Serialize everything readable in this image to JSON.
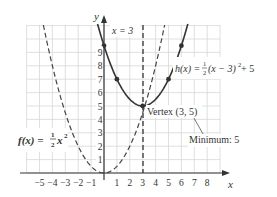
{
  "chart_data": {
    "type": "line",
    "title": "",
    "xlabel": "x",
    "ylabel": "y",
    "xlim": [
      -6,
      9
    ],
    "ylim": [
      -0.5,
      11
    ],
    "grid": true,
    "x_ticks": [
      "-5",
      "-4",
      "-3",
      "-2",
      "-1",
      "1",
      "2",
      "3",
      "4",
      "5",
      "6",
      "7",
      "8"
    ],
    "y_ticks": [
      "1",
      "2",
      "3",
      "4",
      "5",
      "6",
      "7",
      "8",
      "9"
    ],
    "series": [
      {
        "name": "f(x) = ½x²",
        "style": "dashed",
        "color": "#444444",
        "equation": "f(x) = (1/2)x^2",
        "points": [
          [
            -5,
            12.5
          ],
          [
            -4,
            8
          ],
          [
            -3,
            4.5
          ],
          [
            -2,
            2
          ],
          [
            -1,
            0.5
          ],
          [
            0,
            0
          ],
          [
            1,
            0.5
          ],
          [
            2,
            2
          ],
          [
            3,
            4.5
          ],
          [
            4,
            8
          ],
          [
            5,
            12.5
          ]
        ]
      },
      {
        "name": "h(x) = ½(x − 3)² + 5",
        "style": "solid",
        "color": "#333333",
        "equation": "h(x) = (1/2)(x-3)^2 + 5",
        "points": [
          [
            -1,
            13
          ],
          [
            0,
            9.5
          ],
          [
            1,
            7
          ],
          [
            2,
            5.5
          ],
          [
            3,
            5
          ],
          [
            4,
            5.5
          ],
          [
            5,
            7
          ],
          [
            6,
            9.5
          ],
          [
            7,
            13
          ]
        ],
        "marked_points": [
          [
            0,
            9.5
          ],
          [
            1,
            7
          ],
          [
            3,
            5
          ],
          [
            5,
            7
          ],
          [
            6,
            9.5
          ]
        ]
      }
    ],
    "annotations": {
      "axis_of_symmetry": "x = 3",
      "vertex": "Vertex (3, 5)",
      "minimum": "Minimum: 5",
      "f_label_lhs": "f(x) = ",
      "f_label_frac_num": "1",
      "f_label_frac_den": "2",
      "f_label_rhs": "x",
      "f_label_exp": "2",
      "h_label_lhs": "h(x) = ",
      "h_label_frac_num": "1",
      "h_label_frac_den": "2",
      "h_label_mid": "(x − 3)",
      "h_label_exp": "2",
      "h_label_rhs": " + 5"
    }
  }
}
